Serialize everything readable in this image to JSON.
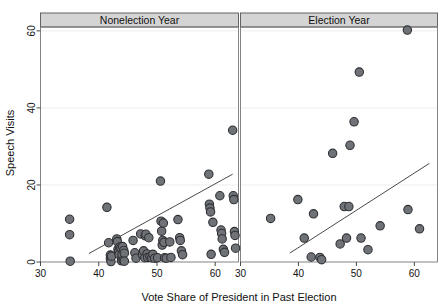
{
  "chart_data": {
    "type": "scatter",
    "title": "",
    "xlabel": "Vote Share of President in Past Election",
    "ylabel": "Speech Visits",
    "xlim": [
      30,
      64
    ],
    "ylim": [
      0,
      61
    ],
    "xticks": [
      30,
      40,
      50,
      60
    ],
    "yticks": [
      0,
      20,
      40,
      60
    ],
    "xtick_labels": [
      "30",
      "40",
      "50",
      "60"
    ],
    "ytick_labels": [
      "0",
      "20",
      "40",
      "60"
    ],
    "grid": "horizontal-faint",
    "legend": "none",
    "marker": {
      "shape": "circle",
      "fill": "#6f7277",
      "edge": "#2f3134",
      "size_px": 4.2
    },
    "fit_line_color": "#4a4a4a",
    "panel_header_fill": "#d4d4d4",
    "panel_header_edge": "#555555",
    "panels": [
      {
        "name": "nonelection-year",
        "label": "Nonelection Year",
        "fit_line": {
          "x0": 38.3,
          "y0": 2.2,
          "x1": 63.0,
          "y1": 22.8
        },
        "points": [
          [
            35.0,
            11.1
          ],
          [
            35.0,
            7.1
          ],
          [
            35.1,
            0.2
          ],
          [
            41.4,
            14.2
          ],
          [
            41.7,
            5.0
          ],
          [
            42.0,
            1.8
          ],
          [
            42.0,
            0.9
          ],
          [
            42.1,
            0.1
          ],
          [
            42.2,
            1.5
          ],
          [
            43.1,
            6.0
          ],
          [
            43.2,
            5.3
          ],
          [
            43.3,
            3.3
          ],
          [
            43.4,
            2.6
          ],
          [
            43.5,
            1.9
          ],
          [
            43.6,
            3.9
          ],
          [
            43.8,
            3.7
          ],
          [
            43.9,
            0.3
          ],
          [
            44.0,
            1.1
          ],
          [
            44.0,
            2.0
          ],
          [
            44.1,
            4.0
          ],
          [
            44.2,
            0.4
          ],
          [
            44.3,
            3.0
          ],
          [
            44.4,
            2.3
          ],
          [
            44.4,
            0.2
          ],
          [
            45.9,
            5.6
          ],
          [
            46.2,
            2.4
          ],
          [
            46.4,
            1.0
          ],
          [
            47.2,
            7.3
          ],
          [
            47.5,
            1.9
          ],
          [
            47.7,
            2.9
          ],
          [
            47.9,
            1.1
          ],
          [
            48.0,
            6.8
          ],
          [
            48.1,
            7.2
          ],
          [
            48.3,
            2.1
          ],
          [
            48.4,
            1.2
          ],
          [
            48.6,
            6.3
          ],
          [
            48.8,
            1.3
          ],
          [
            49.1,
            1.1
          ],
          [
            49.3,
            2.0
          ],
          [
            49.6,
            1.0
          ],
          [
            50.1,
            1.1
          ],
          [
            50.6,
            21.0
          ],
          [
            50.7,
            10.6
          ],
          [
            50.8,
            8.0
          ],
          [
            50.9,
            4.4
          ],
          [
            51.0,
            5.6
          ],
          [
            51.1,
            10.1
          ],
          [
            51.2,
            5.1
          ],
          [
            51.3,
            1.1
          ],
          [
            51.6,
            1.0
          ],
          [
            52.2,
            5.2
          ],
          [
            52.4,
            1.2
          ],
          [
            53.6,
            11.0
          ],
          [
            53.9,
            6.3
          ],
          [
            54.0,
            5.6
          ],
          [
            54.2,
            2.9
          ],
          [
            54.4,
            1.9
          ],
          [
            58.9,
            22.8
          ],
          [
            59.0,
            15.0
          ],
          [
            59.1,
            14.0
          ],
          [
            59.2,
            13.0
          ],
          [
            59.3,
            2.0
          ],
          [
            59.6,
            10.3
          ],
          [
            60.8,
            17.2
          ],
          [
            61.0,
            8.3
          ],
          [
            61.1,
            7.4
          ],
          [
            61.2,
            6.0
          ],
          [
            61.4,
            3.3
          ],
          [
            61.6,
            2.5
          ],
          [
            63.0,
            34.2
          ],
          [
            63.1,
            17.2
          ],
          [
            63.2,
            16.2
          ],
          [
            63.3,
            7.9
          ],
          [
            63.4,
            6.9
          ],
          [
            63.5,
            3.6
          ]
        ]
      },
      {
        "name": "election-year",
        "label": "Election Year",
        "fit_line": {
          "x0": 38.5,
          "y0": 2.3,
          "x1": 62.6,
          "y1": 25.6
        },
        "points": [
          [
            35.2,
            11.3
          ],
          [
            39.9,
            16.2
          ],
          [
            41.0,
            6.2
          ],
          [
            42.2,
            1.3
          ],
          [
            42.6,
            12.5
          ],
          [
            43.7,
            1.2
          ],
          [
            44.0,
            0.6
          ],
          [
            45.9,
            28.2
          ],
          [
            47.2,
            4.7
          ],
          [
            47.9,
            14.4
          ],
          [
            48.3,
            6.2
          ],
          [
            48.7,
            14.4
          ],
          [
            48.9,
            30.3
          ],
          [
            49.6,
            36.4
          ],
          [
            50.5,
            49.3
          ],
          [
            50.8,
            6.2
          ],
          [
            52.0,
            3.2
          ],
          [
            54.1,
            9.4
          ],
          [
            58.8,
            60.2
          ],
          [
            58.9,
            13.6
          ],
          [
            60.9,
            8.6
          ]
        ]
      }
    ]
  },
  "axis": {
    "ylabel": "Speech Visits",
    "xlabel": "Vote Share of President in Past Election"
  }
}
